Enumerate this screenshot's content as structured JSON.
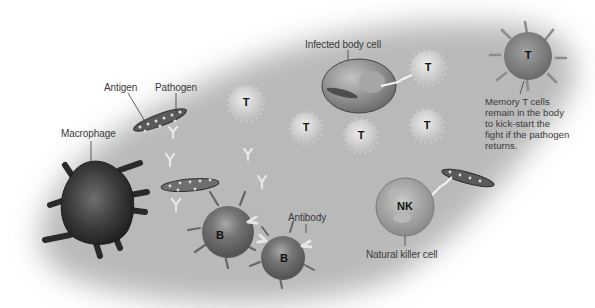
{
  "diagram": {
    "title": "",
    "labels": {
      "antigen": "Antigen",
      "pathogen": "Pathogen",
      "macrophage": "Macrophage",
      "infected_body_cell": "Infected body cell",
      "antibody": "Antibody",
      "natural_killer_cell": "Natural killer cell",
      "memory_t_note": "Memory T cells\nremain in the body\nto kick-start the\nfight if the pathogen\nreturns."
    },
    "cell_letters": {
      "t_cell": "T",
      "b_cell": "B",
      "nk_cell": "NK"
    },
    "colors": {
      "background_field": "#b9b9b9",
      "macrophage": "#2e2e2e",
      "b_cell": "#6e6e6e",
      "t_cell": "#d2d2d2",
      "memory_t_cell": "#8a8a8a",
      "infected_cell": "#8f8f8f",
      "nk_cell": "#9d9d9d",
      "antibody": "#e6e6e6",
      "label_text": "#3a3a3a"
    }
  }
}
